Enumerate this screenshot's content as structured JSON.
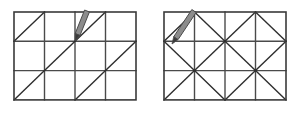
{
  "canvas": {
    "width": 300,
    "height": 116,
    "background": "#ffffff"
  },
  "style": {
    "grid_line_color": "#4a4a4a",
    "border_line_color": "#3a3a3a",
    "diagonal_line_color": "#2e2e2e",
    "pencil_body_color": "#8c8c8c",
    "pencil_outline_color": "#4a4a4a",
    "pencil_tip_color": "#3a3a3a",
    "grid_line_width": 1.4,
    "border_line_width": 1.6,
    "diagonal_line_width": 1.4
  },
  "figures": [
    {
      "id": "left-figure",
      "name": "grid-with-parallel-diagonals",
      "label": "",
      "grid": {
        "origin_x": 14,
        "origin_y": 12,
        "cell_width": 30.5,
        "cell_height": 29.3,
        "columns": 4,
        "rows": 3
      },
      "diagonals": [
        {
          "row": 0,
          "col": 0,
          "dir": "/"
        },
        {
          "row": 0,
          "col": 2,
          "dir": "/"
        },
        {
          "row": 1,
          "col": 1,
          "dir": "/"
        },
        {
          "row": 1,
          "col": 3,
          "dir": "/"
        },
        {
          "row": 2,
          "col": 0,
          "dir": "/"
        },
        {
          "row": 2,
          "col": 2,
          "dir": "/"
        }
      ],
      "pencil": {
        "tip_x": 75,
        "tip_y": 41,
        "end_x": 87,
        "end_y": 11,
        "width": 5.2
      }
    },
    {
      "id": "right-figure",
      "name": "grid-with-alternating-diagonals",
      "label": "",
      "grid": {
        "origin_x": 14,
        "origin_y": 12,
        "cell_width": 30.5,
        "cell_height": 29.3,
        "columns": 4,
        "rows": 3
      },
      "diagonals": [
        {
          "row": 0,
          "col": 0,
          "dir": "/"
        },
        {
          "row": 0,
          "col": 1,
          "dir": "\\"
        },
        {
          "row": 0,
          "col": 2,
          "dir": "/"
        },
        {
          "row": 0,
          "col": 3,
          "dir": "\\"
        },
        {
          "row": 1,
          "col": 0,
          "dir": "\\"
        },
        {
          "row": 1,
          "col": 1,
          "dir": "/"
        },
        {
          "row": 1,
          "col": 2,
          "dir": "\\"
        },
        {
          "row": 1,
          "col": 3,
          "dir": "/"
        },
        {
          "row": 2,
          "col": 0,
          "dir": "/"
        },
        {
          "row": 2,
          "col": 1,
          "dir": "\\"
        },
        {
          "row": 2,
          "col": 2,
          "dir": "/"
        },
        {
          "row": 2,
          "col": 3,
          "dir": "\\"
        }
      ],
      "pencil": {
        "tip_x": 22,
        "tip_y": 44,
        "end_x": 44,
        "end_y": 11,
        "width": 5.2
      }
    }
  ]
}
